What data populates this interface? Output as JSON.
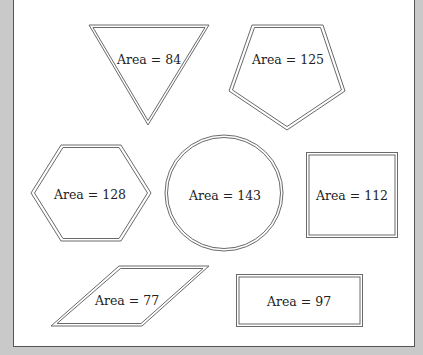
{
  "diagram": {
    "background_color": "#c9c9c9",
    "panel_color": "#ffffff",
    "outline_color": "#6a6a6a",
    "shapes": [
      {
        "type": "triangle",
        "label": "Area = 84"
      },
      {
        "type": "pentagon",
        "label": "Area = 125"
      },
      {
        "type": "hexagon",
        "label": "Area = 128"
      },
      {
        "type": "circle",
        "label": "Area = 143"
      },
      {
        "type": "square",
        "label": "Area = 112"
      },
      {
        "type": "parallelogram",
        "label": "Area = 77"
      },
      {
        "type": "rectangle",
        "label": "Area = 97"
      }
    ]
  }
}
